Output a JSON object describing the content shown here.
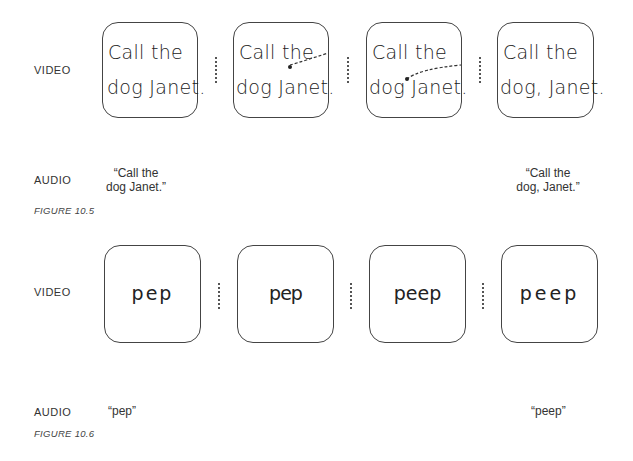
{
  "figure_a": {
    "video_label": "VIDEO",
    "audio_label": "AUDIO",
    "caption": "FIGURE 10.5",
    "panels": [
      {
        "line1": "Call the",
        "line2": "dog Janet."
      },
      {
        "line1": "Call the",
        "line2": "dog Janet."
      },
      {
        "line1": "Call the",
        "line2": "dog Janet."
      },
      {
        "line1": "Call the",
        "line2": "dog, Janet."
      }
    ],
    "audio_left": {
      "line1": "“Call the",
      "line2": "dog Janet.”"
    },
    "audio_right": {
      "line1": "“Call the",
      "line2": "dog, Janet.”"
    }
  },
  "figure_b": {
    "video_label": "VIDEO",
    "audio_label": "AUDIO",
    "caption": "FIGURE 10.6",
    "panels": [
      {
        "text": "pep"
      },
      {
        "text": "pep"
      },
      {
        "text": "peep"
      },
      {
        "text": "peep"
      }
    ],
    "audio_left": "“pep”",
    "audio_right": "“peep”"
  }
}
